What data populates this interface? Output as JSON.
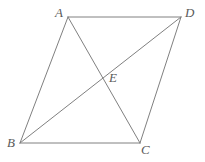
{
  "figure": {
    "type": "geometry-diagram",
    "background_color": "#ffffff",
    "stroke_color": "#808080",
    "label_color": "#5a5a5a",
    "stroke_width": 1,
    "points": {
      "A": {
        "label": "A",
        "x": 68,
        "y": 17
      },
      "D": {
        "label": "D",
        "x": 181,
        "y": 17
      },
      "B": {
        "label": "B",
        "x": 20,
        "y": 143
      },
      "C": {
        "label": "C",
        "x": 140,
        "y": 143
      },
      "E": {
        "label": "E",
        "x": 101,
        "y": 77
      }
    },
    "segments": [
      {
        "name": "AD",
        "from": "A",
        "to": "D"
      },
      {
        "name": "AB",
        "from": "A",
        "to": "B"
      },
      {
        "name": "BC",
        "from": "B",
        "to": "C"
      },
      {
        "name": "CD",
        "from": "C",
        "to": "D"
      },
      {
        "name": "AC",
        "from": "A",
        "to": "C"
      },
      {
        "name": "BD",
        "from": "B",
        "to": "D"
      }
    ]
  }
}
